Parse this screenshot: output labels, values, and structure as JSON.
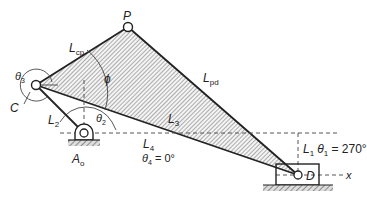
{
  "figure": {
    "type": "linkage-diagram"
  },
  "points": {
    "P": {
      "label": "P",
      "x": 128,
      "y": 27
    },
    "C": {
      "label": "C",
      "x": 36,
      "y": 85
    },
    "A0": {
      "label": "A",
      "sub": "o",
      "x": 84,
      "y": 133
    },
    "D": {
      "label": "D",
      "x": 298,
      "y": 175
    }
  },
  "links": {
    "L_cp": {
      "label": "L",
      "sub": "cp"
    },
    "L_pd": {
      "label": "L",
      "sub": "pd"
    },
    "L2": {
      "label": "L",
      "sub": "2"
    },
    "L3": {
      "label": "L",
      "sub": "3"
    },
    "L4": {
      "label": "L",
      "sub": "4"
    },
    "L1": {
      "label": "L",
      "sub": "1"
    }
  },
  "angles": {
    "theta3": {
      "label": "θ",
      "sub": "3"
    },
    "theta2": {
      "label": "θ",
      "sub": "2"
    },
    "phi": {
      "label": "ϕ"
    },
    "theta4": {
      "label": "θ",
      "sub": "4",
      "value": " = 0°"
    },
    "theta1": {
      "label": "θ",
      "sub": "1",
      "value": " = 270°"
    }
  },
  "axis": {
    "x_label": "x"
  },
  "colors": {
    "line": "#222222",
    "hatch": "#555555",
    "dashed": "#555555",
    "background": "#ffffff"
  }
}
